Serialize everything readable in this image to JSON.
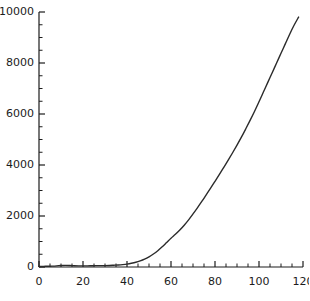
{
  "chart_data": {
    "type": "line",
    "title": "",
    "subtitle": "",
    "xlabel": "",
    "ylabel": "",
    "xlim": [
      0,
      120
    ],
    "ylim": [
      0,
      10000
    ],
    "grid": false,
    "legend": null,
    "x_ticks": [
      0,
      20,
      40,
      60,
      80,
      100,
      120
    ],
    "x_tick_labels": [
      "0",
      "20",
      "40",
      "60",
      "80",
      "100",
      "120"
    ],
    "x_minor_step": 5,
    "y_ticks": [
      0,
      2000,
      4000,
      6000,
      8000,
      10000
    ],
    "y_tick_labels": [
      "0",
      "2000",
      "4000",
      "6000",
      "8000",
      "10000"
    ],
    "y_minor_step": 500,
    "line_color": "#2b2b2b",
    "line_width": 1.4,
    "axis_color": "#1c1c1c",
    "background": "#ffffff",
    "series": [
      {
        "name": "series-1",
        "x": [
          0,
          2,
          4,
          6,
          8,
          10,
          12,
          14,
          16,
          18,
          20,
          22,
          24,
          26,
          28,
          30,
          32,
          34,
          36,
          38,
          40,
          42,
          44,
          46,
          48,
          50,
          52,
          54,
          56,
          58,
          60,
          62,
          64,
          66,
          68,
          70,
          72,
          74,
          76,
          78,
          80,
          82,
          84,
          86,
          88,
          90,
          92,
          94,
          96,
          98,
          100,
          102,
          104,
          106,
          108,
          110,
          112,
          114,
          116,
          118
        ],
        "y": [
          20,
          25,
          30,
          35,
          45,
          60,
          65,
          60,
          50,
          45,
          45,
          45,
          50,
          55,
          55,
          55,
          60,
          70,
          80,
          95,
          115,
          145,
          185,
          240,
          310,
          400,
          510,
          640,
          790,
          960,
          1130,
          1280,
          1450,
          1640,
          1850,
          2080,
          2320,
          2570,
          2830,
          3090,
          3360,
          3630,
          3910,
          4190,
          4480,
          4780,
          5090,
          5420,
          5760,
          6110,
          6480,
          6860,
          7240,
          7620,
          8000,
          8380,
          8760,
          9140,
          9490,
          9800
        ]
      }
    ]
  },
  "figure": {
    "plot_left_px": 39,
    "plot_right_px": 303,
    "plot_top_px": 12,
    "plot_bottom_px": 267
  }
}
